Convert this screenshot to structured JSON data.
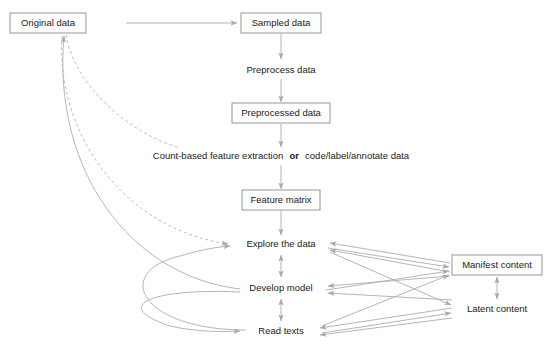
{
  "diagram": {
    "colors": {
      "background": "#ffffff",
      "box_stroke": "#8c8c8c",
      "edge": "#adadad",
      "text": "#1a1a1a"
    },
    "nodes": [
      {
        "id": "original-data",
        "label": "Original data",
        "boxed": true,
        "x": 48,
        "y": 23,
        "w": 76,
        "h": 20
      },
      {
        "id": "sampled-data",
        "label": "Sampled data",
        "boxed": true,
        "x": 281,
        "y": 23,
        "w": 80,
        "h": 20
      },
      {
        "id": "preprocess-data",
        "label": "Preprocess data",
        "boxed": false,
        "x": 281,
        "y": 70,
        "w": 84,
        "h": 16
      },
      {
        "id": "preprocessed-data",
        "label": "Preprocessed data",
        "boxed": true,
        "x": 281,
        "y": 113,
        "w": 98,
        "h": 20
      },
      {
        "id": "feature-extraction",
        "label": "Count-based feature extraction",
        "label_bold": "or",
        "label_tail": "code/label/annotate data",
        "boxed": false,
        "x": 281,
        "y": 156,
        "w": 280,
        "h": 16
      },
      {
        "id": "feature-matrix",
        "label": "Feature matrix",
        "boxed": true,
        "x": 281,
        "y": 200,
        "w": 78,
        "h": 20
      },
      {
        "id": "explore-the-data",
        "label": "Explore the data",
        "boxed": false,
        "x": 281,
        "y": 244,
        "w": 82,
        "h": 16
      },
      {
        "id": "develop-model",
        "label": "Develop model",
        "boxed": false,
        "x": 281,
        "y": 288,
        "w": 78,
        "h": 16
      },
      {
        "id": "read-texts",
        "label": "Read texts",
        "boxed": false,
        "x": 281,
        "y": 331,
        "w": 62,
        "h": 16
      },
      {
        "id": "manifest-content",
        "label": "Manifest content",
        "boxed": true,
        "x": 497,
        "y": 265,
        "w": 90,
        "h": 20
      },
      {
        "id": "latent-content",
        "label": "Latent content",
        "boxed": false,
        "x": 497,
        "y": 309,
        "w": 80,
        "h": 16
      }
    ],
    "edges": [
      {
        "id": "original-to-sampled",
        "from": "original-data",
        "to": "sampled-data",
        "style": "solid",
        "arrows": "end"
      },
      {
        "id": "sampled-to-preprocess",
        "from": "sampled-data",
        "to": "preprocess-data",
        "style": "solid",
        "arrows": "end"
      },
      {
        "id": "preprocess-to-preprocessed",
        "from": "preprocess-data",
        "to": "preprocessed-data",
        "style": "solid",
        "arrows": "end"
      },
      {
        "id": "preprocessed-to-extraction",
        "from": "preprocessed-data",
        "to": "feature-extraction",
        "style": "solid",
        "arrows": "end"
      },
      {
        "id": "extraction-to-feature-matrix",
        "from": "feature-extraction",
        "to": "feature-matrix",
        "style": "solid",
        "arrows": "end"
      },
      {
        "id": "feature-matrix-to-explore",
        "from": "feature-matrix",
        "to": "explore-the-data",
        "style": "solid",
        "arrows": "end"
      },
      {
        "id": "original-to-extraction-dashed",
        "from": "original-data",
        "to": "feature-extraction",
        "style": "dashed",
        "arrows": "end"
      },
      {
        "id": "original-to-explore-dashed",
        "from": "original-data",
        "to": "explore-the-data",
        "style": "dashed",
        "arrows": "end"
      },
      {
        "id": "develop-model-to-original",
        "from": "develop-model",
        "to": "original-data",
        "style": "solid",
        "arrows": "end"
      },
      {
        "id": "read-texts-to-explore-curve",
        "from": "read-texts",
        "to": "explore-the-data",
        "style": "solid",
        "arrows": "end"
      },
      {
        "id": "develop-model-to-read-texts-curve",
        "from": "develop-model",
        "to": "read-texts",
        "style": "solid",
        "arrows": "end"
      },
      {
        "id": "explore-develop-bidir",
        "from": "explore-the-data",
        "to": "develop-model",
        "style": "solid",
        "arrows": "both"
      },
      {
        "id": "develop-read-bidir",
        "from": "develop-model",
        "to": "read-texts",
        "style": "solid",
        "arrows": "both"
      },
      {
        "id": "manifest-latent-bidir",
        "from": "manifest-content",
        "to": "latent-content",
        "style": "solid",
        "arrows": "both"
      },
      {
        "id": "manifest-to-explore",
        "from": "manifest-content",
        "to": "explore-the-data",
        "style": "solid",
        "arrows": "end"
      },
      {
        "id": "latent-to-explore",
        "from": "latent-content",
        "to": "explore-the-data",
        "style": "solid",
        "arrows": "end"
      },
      {
        "id": "manifest-to-develop",
        "from": "manifest-content",
        "to": "develop-model",
        "style": "solid",
        "arrows": "end"
      },
      {
        "id": "latent-to-develop",
        "from": "latent-content",
        "to": "develop-model",
        "style": "solid",
        "arrows": "end"
      },
      {
        "id": "manifest-to-read-texts",
        "from": "manifest-content",
        "to": "read-texts",
        "style": "solid",
        "arrows": "end"
      },
      {
        "id": "latent-to-read-texts",
        "from": "latent-content",
        "to": "read-texts",
        "style": "solid",
        "arrows": "end"
      },
      {
        "id": "explore-to-manifest",
        "from": "explore-the-data",
        "to": "manifest-content",
        "style": "solid",
        "arrows": "end"
      },
      {
        "id": "explore-to-latent",
        "from": "explore-the-data",
        "to": "latent-content",
        "style": "solid",
        "arrows": "end"
      },
      {
        "id": "develop-to-manifest",
        "from": "develop-model",
        "to": "manifest-content",
        "style": "solid",
        "arrows": "end"
      },
      {
        "id": "read-texts-to-manifest",
        "from": "read-texts",
        "to": "manifest-content",
        "style": "solid",
        "arrows": "end"
      },
      {
        "id": "read-texts-to-latent",
        "from": "read-texts",
        "to": "latent-content",
        "style": "solid",
        "arrows": "end"
      }
    ]
  }
}
